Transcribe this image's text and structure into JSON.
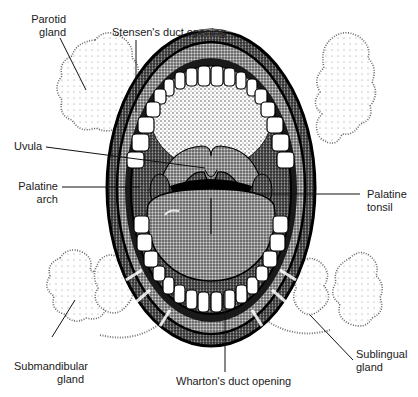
{
  "diagram": {
    "labels": {
      "parotid": [
        "Parotid",
        "gland"
      ],
      "stensen": [
        "Stensen's duct opening"
      ],
      "uvula": [
        "Uvula"
      ],
      "palatine_arch": [
        "Palatine",
        "arch"
      ],
      "palatine_tonsil": [
        "Palatine",
        "tonsil"
      ],
      "submandibular": [
        "Submandibular",
        "gland"
      ],
      "wharton": [
        "Wharton's duct opening"
      ],
      "sublingual": [
        "Sublingual",
        "gland"
      ]
    },
    "colors": {
      "ink": "#111111",
      "stipple": "#444444",
      "tooth": "#ffffff",
      "background": "#ffffff"
    }
  }
}
